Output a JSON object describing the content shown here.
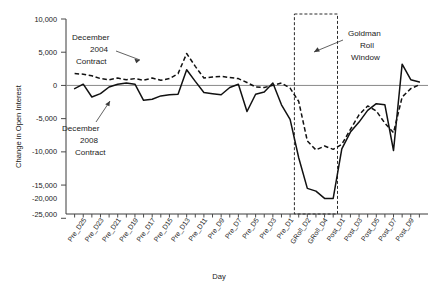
{
  "chart_data": {
    "type": "line",
    "title": "",
    "xlabel": "Day",
    "ylabel": "Change in Open Interest",
    "ylim": [
      -25000,
      10000
    ],
    "yticks": [
      10000,
      5000,
      0,
      -5000,
      -10000,
      -15000,
      -20000,
      -25000
    ],
    "ytick_labels": [
      "10,000",
      "5,000",
      "0",
      "-5,000",
      "-10,000",
      "-15,000",
      "-20,000",
      "-25,000"
    ],
    "grid": false,
    "legend_position": "inline-annotations",
    "categories": [
      "Pre_D26",
      "Pre_D25",
      "Pre_D24",
      "Pre_D23",
      "Pre_D22",
      "Pre_D21",
      "Pre_D20",
      "Pre_D19",
      "Pre_D18",
      "Pre_D17",
      "Pre_D16",
      "Pre_D15",
      "Pre_D14",
      "Pre_D13",
      "Pre_D12",
      "Pre_D11",
      "Pre_D10",
      "Pre_D9",
      "Pre_D8",
      "Pre_D7",
      "Pre_D6",
      "Pre_D5",
      "Pre_D4",
      "Pre_D3",
      "Pre_D2",
      "Pre_D1",
      "GRoll_D1",
      "GRoll_D2",
      "GRoll_D3",
      "GRoll_D4",
      "GRoll_D5",
      "Post_D1",
      "Post_D2",
      "Post_D3",
      "Post_D4",
      "Post_D5",
      "Post_D6",
      "Post_D7",
      "Post_D8",
      "Post_D9",
      "Post_D10"
    ],
    "xtick_labels_shown": [
      "Pre_D25",
      "Pre_D23",
      "Pre_D21",
      "Pre_D19",
      "Pre_D17",
      "Pre_D15",
      "Pre_D13",
      "Pre_D11",
      "Pre_D9",
      "Pre_D7",
      "Pre_D5",
      "Pre_D3",
      "Pre_D1",
      "GRoll_D2",
      "GRoll_D4",
      "Post_D1",
      "Post_D3",
      "Post_D5",
      "Post_D7",
      "Post_D9"
    ],
    "series": [
      {
        "name": "December 2004 Contract",
        "style": "dashed",
        "values": [
          200,
          100,
          -200,
          -700,
          -900,
          -600,
          -900,
          -700,
          -1000,
          -600,
          -1000,
          -700,
          200,
          3800,
          1500,
          -600,
          -400,
          -300,
          -500,
          -700,
          -1400,
          -2200,
          -2300,
          -1900,
          -1500,
          -2400,
          -4800,
          -11900,
          -13500,
          -12800,
          -13400,
          -12500,
          -9800,
          -7200,
          -5600,
          -6500,
          -8700,
          -10400,
          -4000,
          -2500,
          -1800
        ]
      },
      {
        "name": "December 2008 Contract",
        "style": "solid",
        "values": [
          -2500,
          -1700,
          -4000,
          -3400,
          -2200,
          -1700,
          -1500,
          -1700,
          -4600,
          -4400,
          -3800,
          -3600,
          -3500,
          900,
          -1200,
          -3200,
          -3400,
          -3600,
          -2300,
          -1700,
          -6600,
          -3500,
          -3100,
          -1500,
          -5400,
          -8000,
          -14900,
          -20400,
          -20900,
          -22200,
          -22200,
          -13300,
          -10300,
          -8500,
          -6400,
          -5200,
          -5400,
          -13600,
          1900,
          -900,
          -1300
        ]
      }
    ],
    "annotations": [
      {
        "text_lines": [
          "December",
          "2004",
          "Contract"
        ],
        "points_to": "dashed-series-peak"
      },
      {
        "text_lines": [
          "December",
          "2008",
          "Contract"
        ],
        "points_to": "solid-series"
      },
      {
        "text_lines": [
          "Goldman",
          "Roll",
          "Window"
        ],
        "points_to": "roll-window-box"
      }
    ],
    "roll_window": {
      "label": "Goldman Roll Window",
      "from": "GRoll_D1",
      "to": "GRoll_D5"
    }
  }
}
